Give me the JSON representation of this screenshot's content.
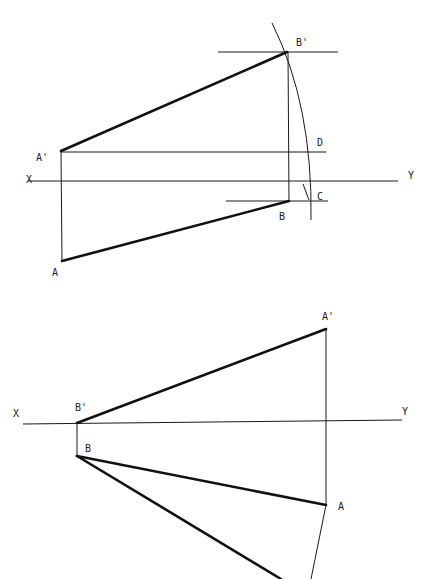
{
  "figure_top": {
    "labels": {
      "b_prime": "B'",
      "a_prime": "A'",
      "d": "D",
      "x": "X",
      "y": "Y",
      "c": "C",
      "b": "B",
      "a": "A"
    },
    "points": {
      "A_prime": [
        61,
        151
      ],
      "B_prime": [
        287,
        52
      ],
      "A": [
        62,
        261
      ],
      "B": [
        289,
        201
      ]
    }
  },
  "figure_bottom": {
    "labels": {
      "a_prime": "A'",
      "x": "X",
      "b_prime": "B'",
      "y": "Y",
      "b": "B",
      "a": "A"
    },
    "points": {
      "A_prime": [
        326,
        329
      ],
      "B_prime": [
        77,
        423
      ],
      "B": [
        77,
        456
      ],
      "A": [
        326,
        505
      ]
    }
  }
}
